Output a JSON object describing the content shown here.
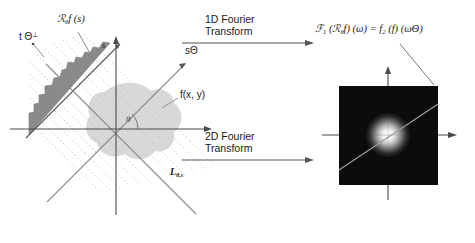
{
  "figure": {
    "background": "#ffffff"
  },
  "left_panel": {
    "name": "spatial-domain-diagram",
    "labels": {
      "radon_profile": "ℛ",
      "radon_profile_sub": "θ",
      "radon_profile_rest": "f (s)",
      "t_theta_perp": "t Θ",
      "t_theta_perp_sup": "⊥",
      "s_axis": "s",
      "s_theta_axis": "sΘ",
      "function_label": "f(x, y)",
      "line_label": "L",
      "line_label_sub": "θ,s",
      "angle_label": "θ"
    },
    "colors": {
      "profile_fill": "#808080",
      "blob_fill": "#d4d4d4",
      "axis": "#555555",
      "ray_lines": "#b9b9b9",
      "dotted_lines": "#c8c8c8"
    }
  },
  "arrows": {
    "top": {
      "name": "arrow-1d-fourier-transform",
      "line1": "1D Fourier",
      "line2": "Transform"
    },
    "bottom": {
      "name": "arrow-2d-fourier-transform",
      "line1": "2D Fourier",
      "line2": "Transform"
    },
    "color": "#555555"
  },
  "right_panel": {
    "name": "frequency-domain-image",
    "formula": {
      "f_cal": "ℱ",
      "f_cal_sub": "1",
      "open": " (",
      "r_cal": "ℛ",
      "r_cal_sub": "θ",
      "rf": "f) (ω) = ",
      "f2": "f",
      "f2_sub": "2",
      "tail": " (f) (ωΘ)",
      "full_text": "ℱ1 (ℛθf) (ω) = f2 (f) (ωΘ)"
    },
    "image": {
      "background": "#0a0a0a",
      "blob_color": "#ffffff",
      "slice_line_color": "#9a9a9a",
      "x": 339,
      "y": 86,
      "width": 99,
      "height": 99
    },
    "axis_color": "#555555"
  }
}
